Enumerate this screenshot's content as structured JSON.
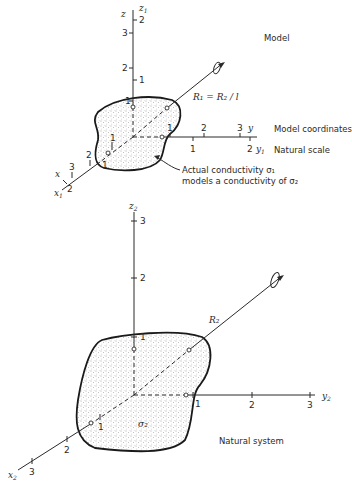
{
  "model": {
    "title": "Model",
    "z_label": "z",
    "z1_label": "z",
    "z1_sub": "1",
    "y_label": "y",
    "y1_label": "y",
    "y1_sub": "1",
    "x_label": "x",
    "x1_label": "x",
    "x1_sub": "1",
    "z_ticks": [
      "1",
      "2",
      "3"
    ],
    "z1_ticks": [
      "1",
      "2"
    ],
    "y_ticks": [
      "1",
      "2",
      "3"
    ],
    "y1_ticks": [
      "1",
      "2"
    ],
    "x_ticks": [
      "1",
      "2",
      "3"
    ],
    "x1_ticks": [
      "1",
      "2"
    ],
    "radius_label": "R₁ = R₂ / l",
    "model_coords_label": "Model coordinates",
    "natural_scale_label": "Natural scale",
    "annotation_line1": "Actual conductivity σ₁",
    "annotation_line2": "models a conductivity of σ₂"
  },
  "natural": {
    "title": "Natural system",
    "z2_label": "z",
    "z2_sub": "2",
    "y2_label": "y",
    "y2_sub": "2",
    "x2_label": "x",
    "x2_sub": "2",
    "z_ticks": [
      "1",
      "2",
      "3"
    ],
    "y_ticks": [
      "1",
      "2",
      "3"
    ],
    "x_ticks": [
      "1",
      "2",
      "3"
    ],
    "radius_label": "R₂",
    "sigma_label": "σ₂"
  }
}
